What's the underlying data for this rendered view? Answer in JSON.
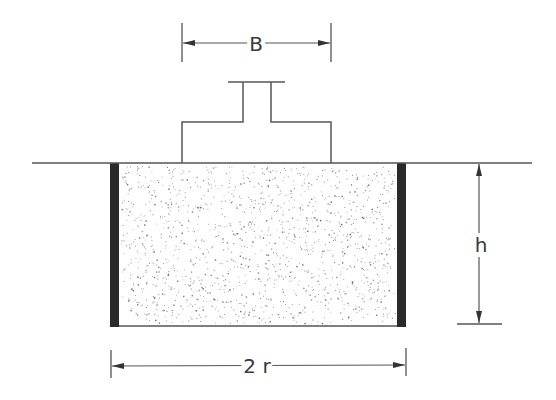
{
  "diagram": {
    "colors": {
      "line": "#555555",
      "wall": "#2a2a2a",
      "dots": "#8a8a8a",
      "label": "#3a3a3a"
    },
    "labels": {
      "width": "B",
      "height": "h",
      "diameter": "2 r"
    },
    "ground": {
      "x1": 32,
      "x2": 532,
      "y": 163
    },
    "footing": {
      "base": {
        "x1": 182,
        "x2": 331,
        "y_top": 122,
        "y_bottom": 163
      },
      "column": {
        "x1": 243,
        "x2": 271,
        "y_top": 82
      },
      "cap": {
        "x1": 228,
        "x2": 285,
        "y": 82
      }
    },
    "soil_column": {
      "x1": 110,
      "x2": 406,
      "y_top": 163,
      "y_bottom": 326,
      "wall_thickness": 9,
      "fill": "stippled sand"
    },
    "dimensions": {
      "B": {
        "x1": 182,
        "x2": 331,
        "y": 43,
        "label_x": 256,
        "label_y": 44
      },
      "h": {
        "x": 479,
        "y1": 163,
        "y2": 324,
        "label_x": 481,
        "label_y": 245
      },
      "2r": {
        "x1": 111,
        "x2": 406,
        "y": 366,
        "label_x": 257,
        "label_y": 366
      }
    }
  }
}
